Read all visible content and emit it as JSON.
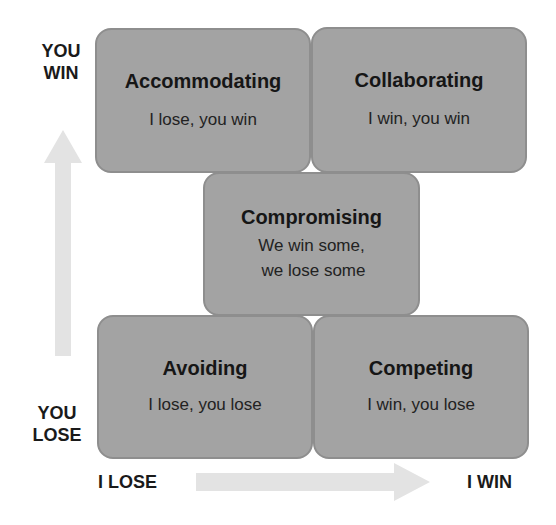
{
  "axes": {
    "y_top": [
      "YOU",
      "WIN"
    ],
    "y_bottom": [
      "YOU",
      "LOSE"
    ],
    "x_left": "I LOSE",
    "x_right": "I WIN"
  },
  "boxes": {
    "accommodating": {
      "title": "Accommodating",
      "sub": "I lose, you win"
    },
    "collaborating": {
      "title": "Collaborating",
      "sub": "I win, you win"
    },
    "compromising": {
      "title": "Compromising",
      "sub": [
        "We win some,",
        "we lose some"
      ]
    },
    "avoiding": {
      "title": "Avoiding",
      "sub": "I lose, you lose"
    },
    "competing": {
      "title": "Competing",
      "sub": "I win, you lose"
    }
  },
  "colors": {
    "box_fill": "#a3a3a3",
    "box_border": "#8e8e8e",
    "arrow": "#e3e3e3"
  }
}
